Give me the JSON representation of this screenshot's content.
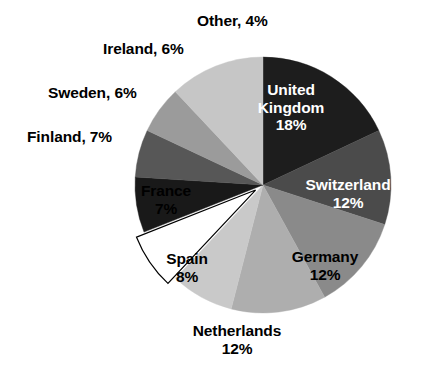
{
  "chart_data": {
    "type": "pie",
    "title": "",
    "subtitle": "",
    "xlabel": "",
    "ylabel": "",
    "legend_position": "none",
    "grid": false,
    "units": "percent",
    "start_angle_deg": 0,
    "direction": "clockwise",
    "categories": [
      "United Kingdom",
      "Switzerland",
      "Germany",
      "Netherlands",
      "Spain",
      "France",
      "Finland",
      "Sweden",
      "Ireland",
      "Other"
    ],
    "values": [
      18,
      12,
      12,
      12,
      8,
      7,
      7,
      6,
      6,
      4
    ],
    "slices": [
      {
        "name": "United Kingdom",
        "value": 18,
        "percent_text": "18%",
        "label_text": "United Kingdom",
        "label_lines": [
          "United",
          "Kingdom",
          "18%"
        ],
        "label_placement": "inside",
        "text_color": "#ffffff",
        "color": "#1d1d1d",
        "exploded": false,
        "start_deg": 0,
        "end_deg": 64.8
      },
      {
        "name": "Switzerland",
        "value": 12,
        "percent_text": "12%",
        "label_text": "Switzerland",
        "label_lines": [
          "Switzerland",
          "12%"
        ],
        "label_placement": "inside",
        "text_color": "#ffffff",
        "color": "#4b4b4b",
        "exploded": false,
        "start_deg": 64.8,
        "end_deg": 108.0
      },
      {
        "name": "Germany",
        "value": 12,
        "percent_text": "12%",
        "label_text": "Germany",
        "label_lines": [
          "Germany",
          "12%"
        ],
        "label_placement": "inside",
        "text_color": "#000000",
        "color": "#8a8a8a",
        "exploded": false,
        "start_deg": 108.0,
        "end_deg": 151.2
      },
      {
        "name": "Netherlands",
        "value": 12,
        "percent_text": "12%",
        "label_text": "Netherlands",
        "label_lines": [
          "Netherlands",
          "12%"
        ],
        "label_placement": "outside-bottom",
        "text_color": "#000000",
        "color": "#aeaeae",
        "exploded": false,
        "start_deg": 151.2,
        "end_deg": 194.4
      },
      {
        "name": "Spain",
        "value": 8,
        "percent_text": "8%",
        "label_text": "Spain",
        "label_lines": [
          "Spain",
          "8%"
        ],
        "label_placement": "inside",
        "text_color": "#000000",
        "color": "#c9c9c9",
        "exploded": false,
        "start_deg": 194.4,
        "end_deg": 223.2
      },
      {
        "name": "France",
        "value": 7,
        "percent_text": "7%",
        "label_text": "France",
        "label_lines": [
          "France",
          "7%"
        ],
        "label_placement": "inside",
        "text_color": "#000000",
        "color": "#ffffff",
        "exploded": true,
        "start_deg": 223.2,
        "end_deg": 248.4
      },
      {
        "name": "Finland",
        "value": 7,
        "percent_text": "7%",
        "label_text": "Finland, 7%",
        "label_lines": [
          "Finland, 7%"
        ],
        "label_placement": "outside-left",
        "text_color": "#000000",
        "color": "#191919",
        "exploded": false,
        "start_deg": 248.4,
        "end_deg": 273.6
      },
      {
        "name": "Sweden",
        "value": 6,
        "percent_text": "6%",
        "label_text": "Sweden, 6%",
        "label_lines": [
          "Sweden, 6%"
        ],
        "label_placement": "outside-left",
        "text_color": "#000000",
        "color": "#575757",
        "exploded": false,
        "start_deg": 273.6,
        "end_deg": 295.2
      },
      {
        "name": "Ireland",
        "value": 6,
        "percent_text": "6%",
        "label_text": "Ireland, 6%",
        "label_lines": [
          "Ireland, 6%"
        ],
        "label_placement": "outside-topleft",
        "text_color": "#000000",
        "color": "#9b9b9b",
        "exploded": false,
        "start_deg": 295.2,
        "end_deg": 316.8
      },
      {
        "name": "Other",
        "value": 4,
        "percent_text": "4%",
        "label_text": "Other, 4%",
        "label_lines": [
          "Other, 4%"
        ],
        "label_placement": "outside-top",
        "text_color": "#000000",
        "color": "#c6c6c6",
        "exploded": false,
        "start_deg": 316.8,
        "end_deg": 360.0
      }
    ],
    "geometry": {
      "center_x": 263,
      "center_y": 185,
      "radius": 128,
      "explode_offset": 9
    },
    "colors": {
      "background": "#ffffff",
      "outline": "#000000",
      "label_dark": "#000000",
      "label_light": "#ffffff"
    }
  },
  "labels": {
    "other": "Other, 4%",
    "ireland": "Ireland, 6%",
    "sweden": "Sweden, 6%",
    "finland": "Finland, 7%",
    "france_name": "France",
    "france_pct": "7%",
    "spain_name": "Spain",
    "spain_pct": "8%",
    "netherlands_name": "Netherlands",
    "netherlands_pct": "12%",
    "germany_name": "Germany",
    "germany_pct": "12%",
    "switzerland_name": "Switzerland",
    "switzerland_pct": "12%",
    "uk_name_line1": "United",
    "uk_name_line2": "Kingdom",
    "uk_pct": "18%"
  }
}
